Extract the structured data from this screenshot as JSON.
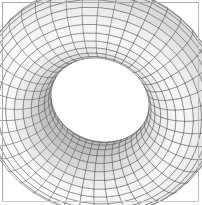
{
  "figure": {
    "title": "Torus wireframe surface plot",
    "caption": "",
    "width": 202,
    "height": 205,
    "background_color": "#ffffff",
    "border_color": "#a8a8a8",
    "border_width": 1
  },
  "chart_data": {
    "type": "surface",
    "title": "Torus wireframe surface plot",
    "subtitle": "",
    "xlabel": "",
    "ylabel": "",
    "zlabel": "",
    "grid": true,
    "legend": null,
    "legend_position": "none",
    "axes_visible": false,
    "tick_labels": [],
    "annotations": [],
    "surface": {
      "name": "torus",
      "equation_u": "x = (R + r*cos(v)) * cos(u)",
      "equation_v": "y = (R + r*cos(v)) * sin(u)",
      "equation_w": "z = r * sin(v)",
      "major_radius": 1.0,
      "minor_radius": 0.42,
      "u_range": [
        0,
        6.283185307179586
      ],
      "v_range": [
        0,
        6.283185307179586
      ],
      "u_segments": 44,
      "v_segments": 26,
      "wireframe": true,
      "hidden_line_removal": true,
      "face_color": "#ffffff",
      "line_color": "#4a4a4a",
      "line_width": 0.45
    },
    "view": {
      "azimuth_deg": 32,
      "elevation_deg": 26,
      "roll_deg": -18,
      "projection": "orthographic",
      "center_x": 100,
      "center_y": 100,
      "scale": 86
    },
    "lighting": {
      "enabled": true,
      "shading_mode": "depth-cue",
      "light_direction": [
        -0.45,
        -0.7,
        0.55
      ],
      "min_shade": "#f2f2f2",
      "max_shade": "#9a9a9a"
    }
  },
  "colors": {
    "background": "#ffffff",
    "border": "#a8a8a8",
    "mesh_line": "#4a4a4a",
    "mesh_line_light": "#8f8f8f",
    "shade_dark": "#9a9a9a",
    "shade_light": "#fdfdfd"
  }
}
